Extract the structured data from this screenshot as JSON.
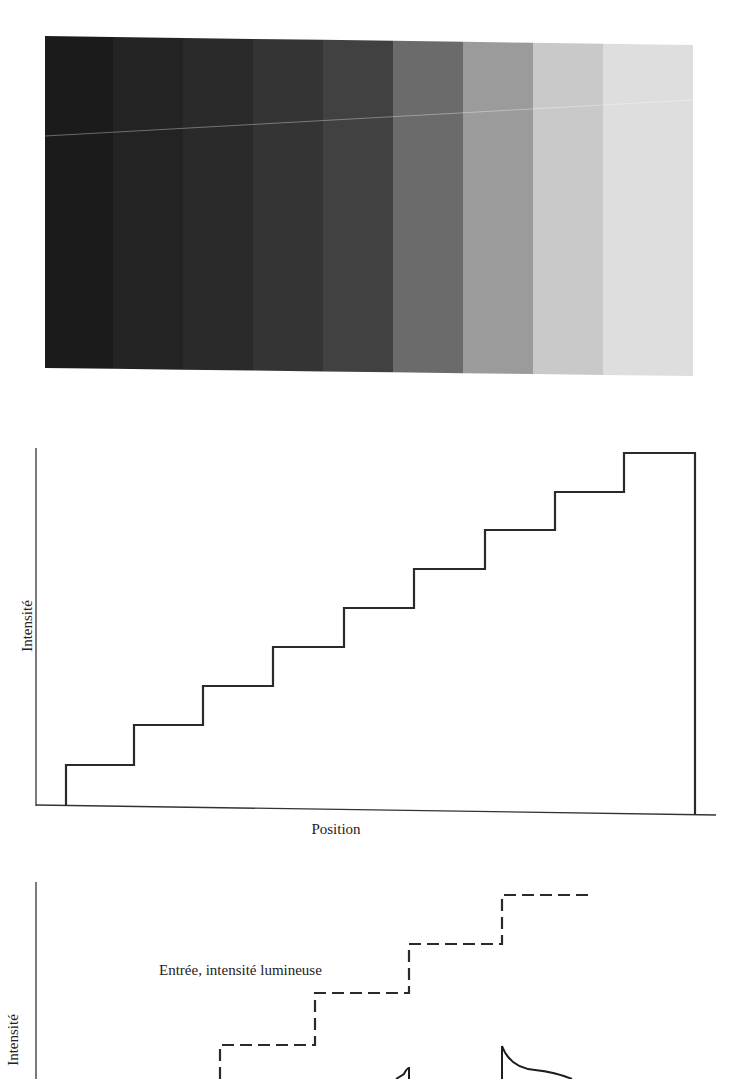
{
  "figure": {
    "grayscale_strip": {
      "band_count": 9,
      "bands": [
        {
          "x": 45,
          "width": 68,
          "color": "#1b1b1b"
        },
        {
          "x": 113,
          "width": 70,
          "color": "#232323"
        },
        {
          "x": 183,
          "width": 70,
          "color": "#2a2a2a"
        },
        {
          "x": 253,
          "width": 70,
          "color": "#343434"
        },
        {
          "x": 323,
          "width": 70,
          "color": "#414141"
        },
        {
          "x": 393,
          "width": 70,
          "color": "#6b6b6b"
        },
        {
          "x": 463,
          "width": 70,
          "color": "#9b9b9b"
        },
        {
          "x": 533,
          "width": 70,
          "color": "#c9c9c9"
        },
        {
          "x": 603,
          "width": 90,
          "color": "#dedede"
        }
      ]
    },
    "staircase_chart": {
      "ylabel": "Intensité",
      "xlabel": "Position"
    },
    "perception_chart": {
      "ylabel": "Intensité",
      "annotation": "Entrée, intensité lumineuse"
    }
  },
  "chart_data": [
    {
      "type": "line",
      "title": "",
      "xlabel": "Position",
      "ylabel": "Intensité",
      "grid": false,
      "description": "Staircase luminance profile of the 9-band grayscale strip",
      "x": [
        1,
        2,
        3,
        4,
        5,
        6,
        7,
        8,
        9
      ],
      "series": [
        {
          "name": "Intensité",
          "style": "solid step",
          "values": [
            1,
            2,
            3,
            4,
            5,
            6,
            7,
            8,
            9
          ]
        }
      ],
      "ylim": [
        0,
        9.3
      ]
    },
    {
      "type": "line",
      "title": "",
      "xlabel": "",
      "ylabel": "Intensité",
      "grid": false,
      "legend": [
        {
          "name": "Entrée, intensité lumineuse",
          "style": "dashed step"
        },
        {
          "name": "Perceived response (Mach bands)",
          "style": "solid curve with overshoot at edges"
        }
      ],
      "x": [
        1,
        2,
        3,
        4,
        5
      ],
      "series": [
        {
          "name": "Entrée, intensité lumineuse",
          "values": [
            1,
            2,
            3,
            4,
            5
          ]
        }
      ]
    }
  ]
}
